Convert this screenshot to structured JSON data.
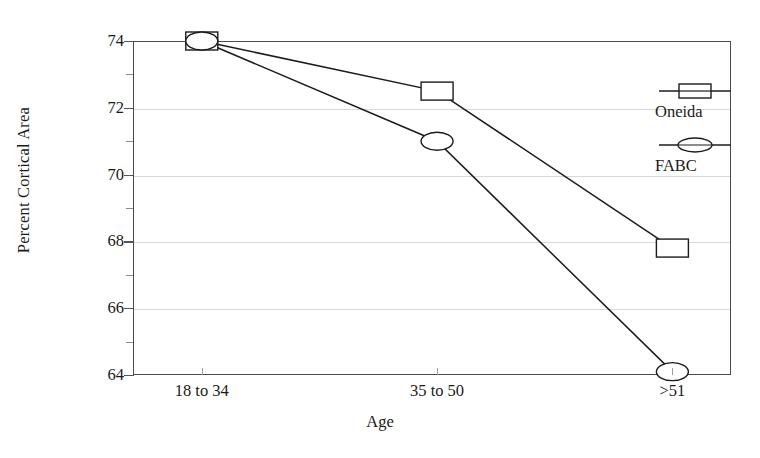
{
  "chart_data": {
    "type": "line",
    "title": "",
    "xlabel": "Age",
    "ylabel": "Percent Cortical Area",
    "categories": [
      "18 to 34",
      "35 to 50",
      ">51"
    ],
    "series": [
      {
        "name": "Oneida",
        "marker": "square",
        "values": [
          74.0,
          72.5,
          67.8
        ]
      },
      {
        "name": "FABC",
        "marker": "ellipse",
        "values": [
          74.0,
          71.0,
          64.1
        ]
      }
    ],
    "ylim": [
      64,
      74
    ],
    "yticks": [
      64,
      66,
      68,
      70,
      72,
      74
    ],
    "ytick_labels": [
      "64",
      "66",
      "68",
      "70",
      "72",
      "74"
    ],
    "yminor_ticks": [
      65,
      67,
      69,
      71,
      73
    ],
    "grid": true,
    "grid_axis": "y",
    "legend_position": "right-inside",
    "line_color": "#1c1c1c",
    "grid_color": "#d9d9d9",
    "frame_color": "#4a4a4a"
  },
  "legend": {
    "entries": [
      {
        "label": "Oneida",
        "symbol": "square-marker-icon"
      },
      {
        "label": "FABC",
        "symbol": "ellipse-marker-icon"
      }
    ]
  },
  "axes": {
    "x_title": "Age",
    "y_title": "Percent Cortical Area"
  }
}
